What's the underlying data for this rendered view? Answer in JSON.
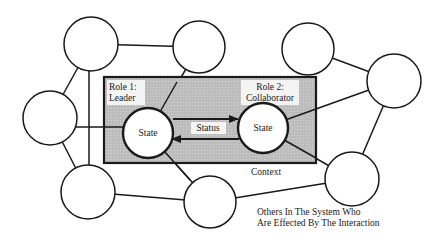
{
  "diagram": {
    "context_label": "Context",
    "role1": {
      "line1": "Role 1:",
      "line2": "Leader",
      "state": "State"
    },
    "role2": {
      "line1": "Role 2:",
      "line2": "Collaborator",
      "state": "State"
    },
    "status_label": "Status",
    "others_caption": {
      "line1": "Others In The System Who",
      "line2": "Are Effected By The Interaction"
    },
    "colors": {
      "context_fill": "#bdbdbd",
      "stroke": "#1a1a1a",
      "background": "#ffffff"
    }
  }
}
